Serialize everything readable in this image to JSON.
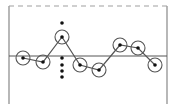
{
  "diagram": {
    "colors": {
      "background": "#ffffff",
      "frame": "#888888",
      "dashed_limit": "#a0a0a0",
      "center_line": "#555555",
      "polyline": "#555555",
      "point_circle": "#555555",
      "point_dot": "#111111",
      "extra_dot": "#111111"
    },
    "frame": {
      "left_x": 9,
      "right_x": 167,
      "top_y": 6,
      "bottom_y": 104
    },
    "upper_limit_y": 6,
    "center_line_y": 56,
    "points": [
      {
        "x": 23,
        "y": 58
      },
      {
        "x": 43,
        "y": 62
      },
      {
        "x": 62,
        "y": 37
      },
      {
        "x": 80,
        "y": 65
      },
      {
        "x": 99,
        "y": 70
      },
      {
        "x": 120,
        "y": 45
      },
      {
        "x": 138,
        "y": 48
      },
      {
        "x": 155,
        "y": 65
      }
    ],
    "extra_dots": [
      {
        "x": 62,
        "y": 23
      },
      {
        "x": 62,
        "y": 58
      },
      {
        "x": 62,
        "y": 65
      },
      {
        "x": 62,
        "y": 71
      },
      {
        "x": 62,
        "y": 77
      }
    ],
    "circle_radius": 7
  }
}
